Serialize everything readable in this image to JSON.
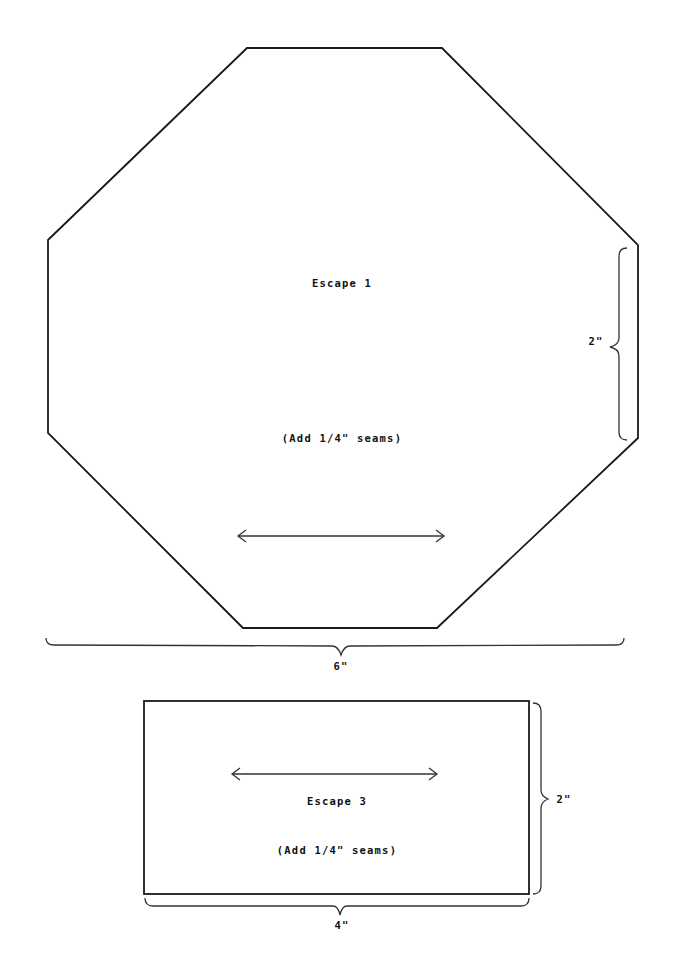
{
  "pieces": [
    {
      "name": "Escape 1",
      "shape": "octagon",
      "title": "Escape 1",
      "seam_note": "(Add 1/4\" seams)",
      "width_label": "6\"",
      "side_label": "2\""
    },
    {
      "name": "Escape 3",
      "shape": "rectangle",
      "title": "Escape 3",
      "seam_note": "(Add 1/4\" seams)",
      "width_label": "4\"",
      "height_label": "2\""
    }
  ],
  "colors": {
    "outline": "#1a1a1a",
    "background": "#ffffff"
  }
}
